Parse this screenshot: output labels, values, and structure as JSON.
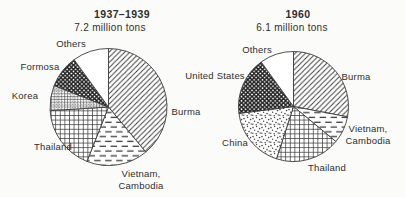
{
  "figure": {
    "background_color": "#fbfbf9",
    "ink_color": "#3c3c3c",
    "description_visible_text_only": true
  },
  "chart_data": [
    {
      "type": "pie",
      "title": "1937–1939",
      "subtitle": "7.2 million tons",
      "values_unit": "percent of total (estimated from segment angles)",
      "layout": {
        "cx": 108.5,
        "cy": 107,
        "r": 58.5,
        "title_x": 122,
        "subtitle_x": 110,
        "start_angle_deg": 0,
        "clockwise": true
      },
      "slices": [
        {
          "label": "Burma",
          "value": 39,
          "pattern": "hatch",
          "label_pos": {
            "x": 186,
            "y": 112
          }
        },
        {
          "label": "Vietnam,\nCambodia",
          "value": 17,
          "pattern": "dashes",
          "label_pos": {
            "x": 141,
            "y": 180
          }
        },
        {
          "label": "Thailand",
          "value": 18,
          "pattern": "grid",
          "label_pos": {
            "x": 53,
            "y": 147
          }
        },
        {
          "label": "Korea",
          "value": 7,
          "pattern": "waffle",
          "label_pos": {
            "x": 25,
            "y": 96
          }
        },
        {
          "label": "Formosa",
          "value": 9,
          "pattern": "diamonds",
          "label_pos": {
            "x": 40,
            "y": 67
          }
        },
        {
          "label": "Others",
          "value": 10,
          "pattern": "plain",
          "label_pos": {
            "x": 71,
            "y": 44
          }
        }
      ]
    },
    {
      "type": "pie",
      "title": "1960",
      "subtitle": "6.1 million tons",
      "values_unit": "percent of total (estimated from segment angles)",
      "layout": {
        "cx": 293.5,
        "cy": 106.5,
        "r": 55,
        "title_x": 298,
        "subtitle_x": 292,
        "start_angle_deg": 0,
        "clockwise": true
      },
      "slices": [
        {
          "label": "Burma",
          "value": 28,
          "pattern": "hatch",
          "label_pos": {
            "x": 356,
            "y": 77
          }
        },
        {
          "label": "Vietnam,\nCambodia",
          "value": 8,
          "pattern": "dashes",
          "label_pos": {
            "x": 368,
            "y": 135
          }
        },
        {
          "label": "Thailand",
          "value": 19,
          "pattern": "grid",
          "label_pos": {
            "x": 327,
            "y": 168
          }
        },
        {
          "label": "China",
          "value": 18,
          "pattern": "stipple",
          "label_pos": {
            "x": 235,
            "y": 143
          }
        },
        {
          "label": "United States",
          "value": 17,
          "pattern": "diamonds",
          "label_pos": {
            "x": 215,
            "y": 76
          }
        },
        {
          "label": "Others",
          "value": 10,
          "pattern": "plain",
          "label_pos": {
            "x": 257,
            "y": 50
          }
        }
      ]
    }
  ]
}
